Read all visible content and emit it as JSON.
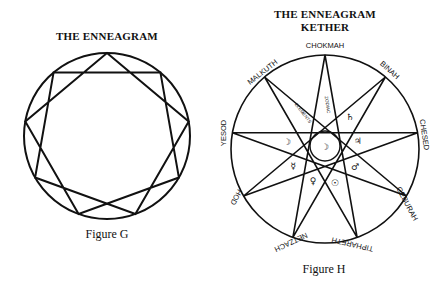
{
  "figure_g": {
    "title": "THE ENNEAGRAM",
    "caption": "Figure G"
  },
  "figure_h": {
    "title_line1": "THE ENNEAGRAM",
    "title_line2": "KETHER",
    "caption": "Figure H",
    "outer_labels": {
      "chokmah": "CHOKMAH",
      "binah": "BINAH",
      "chesed": "CHESED",
      "geburah": "GEBURAH",
      "tiphareth": "TIPHARETH",
      "netzach": "NETZACH",
      "hod": "HOD",
      "yesod": "YESOD",
      "malkuth": "MALKUTH"
    },
    "inner_labels": {
      "elements": "ELEMENTS",
      "zodiac": "ZODIAC",
      "saturn": "♄",
      "jupiter": "♃",
      "mars": "♂",
      "sun": "☉",
      "venus": "♀",
      "mercury": "☿",
      "moon_left": "☽",
      "moon_center": "☽"
    }
  }
}
